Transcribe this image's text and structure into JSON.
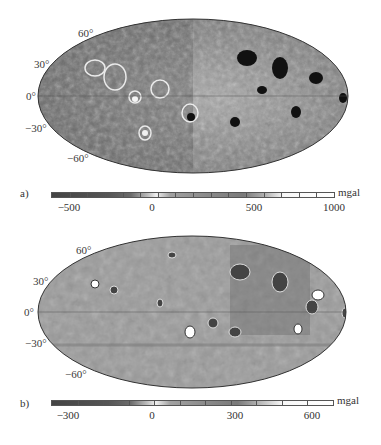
{
  "figure": {
    "panels": [
      {
        "id": "a",
        "label": "a)",
        "lat_labels": [
          "60°",
          "30°",
          "0°",
          "−30°",
          "−60°"
        ],
        "colorbar": {
          "unit": "mgal",
          "min": -600,
          "max": 1000,
          "tick_step": 100,
          "labels": [
            {
              "value": -500,
              "text": "−500"
            },
            {
              "value": 0,
              "text": "0"
            },
            {
              "value": 500,
              "text": "500"
            },
            {
              "value": 1000,
              "text": "1000"
            }
          ]
        }
      },
      {
        "id": "b",
        "label": "b)",
        "lat_labels": [
          "60°",
          "30°",
          "0°",
          "−30°",
          "−60°"
        ],
        "colorbar": {
          "unit": "mgal",
          "min": -400,
          "max": 700,
          "tick_step": 100,
          "labels": [
            {
              "value": -300,
              "text": "−300"
            },
            {
              "value": 0,
              "text": "0"
            },
            {
              "value": 300,
              "text": "300"
            },
            {
              "value": 600,
              "text": "600"
            }
          ]
        }
      }
    ],
    "colors": {
      "cbar_dark": "#4a4a4a",
      "cbar_mid": "#8c8c8c",
      "cbar_light": "#f2f2f2",
      "map_base_a": "#8a8a8a",
      "map_base_b": "#9a9a9a"
    }
  }
}
